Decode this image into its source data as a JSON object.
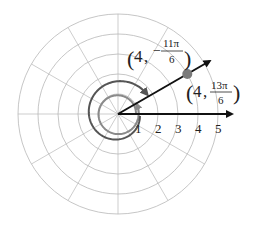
{
  "figure": {
    "type": "polar-coordinate-diagram",
    "center": [
      118,
      114
    ],
    "unit_px": 20,
    "rings": [
      1,
      2,
      3,
      4,
      5
    ],
    "spoke_step_deg": 30,
    "axis_tick_labels": [
      "1",
      "2",
      "3",
      "4",
      "5"
    ],
    "point": {
      "r": 4,
      "theta_deg": 30
    },
    "labels": {
      "negative": {
        "r": "4",
        "sign": "−",
        "num": "11π",
        "den": "6"
      },
      "positive": {
        "r": "4",
        "num": "13π",
        "den": "6"
      }
    },
    "colors": {
      "grid": "#b8b8b8",
      "axis_ray": "#111111",
      "spiral_negative": "#555555",
      "spiral_positive": "#8a8a8a",
      "point": "#7a7a7a"
    }
  }
}
